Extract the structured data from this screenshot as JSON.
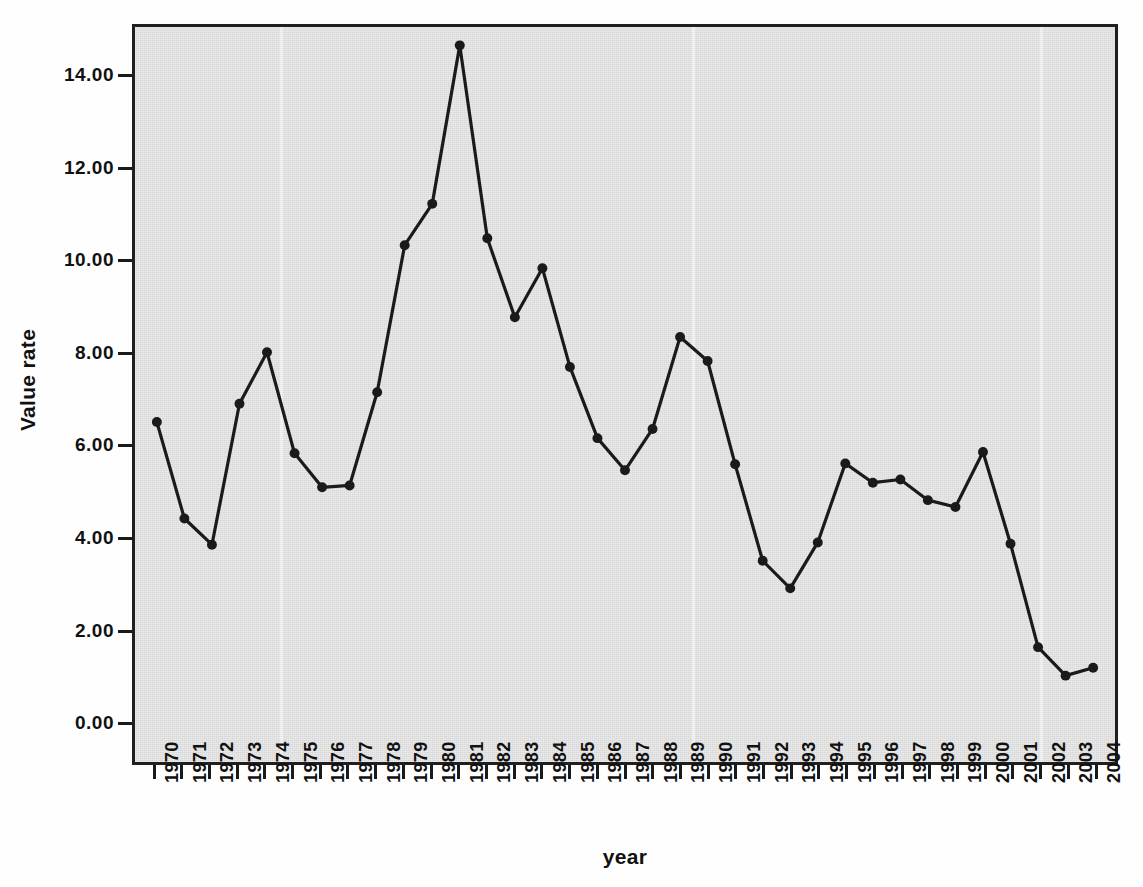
{
  "chart_data": {
    "type": "line",
    "title": "",
    "xlabel": "year",
    "ylabel": "Value rate",
    "x": [
      1970,
      1971,
      1972,
      1973,
      1974,
      1975,
      1976,
      1977,
      1978,
      1979,
      1980,
      1981,
      1982,
      1983,
      1984,
      1985,
      1986,
      1987,
      1988,
      1989,
      1990,
      1991,
      1992,
      1993,
      1994,
      1995,
      1996,
      1997,
      1998,
      1999,
      2000,
      2001,
      2002,
      2003,
      2004
    ],
    "categories": [
      "1970",
      "1971",
      "1972",
      "1973",
      "1974",
      "1975",
      "1976",
      "1977",
      "1978",
      "1979",
      "1980",
      "1981",
      "1982",
      "1983",
      "1984",
      "1985",
      "1986",
      "1987",
      "1988",
      "1989",
      "1990",
      "1991",
      "1992",
      "1993",
      "1994",
      "1995",
      "1996",
      "1997",
      "1998",
      "1999",
      "2000",
      "2001",
      "2002",
      "2003",
      "2004"
    ],
    "values": [
      6.5,
      4.4,
      3.83,
      6.9,
      8.02,
      5.82,
      5.08,
      5.12,
      7.15,
      10.35,
      11.25,
      14.7,
      10.5,
      8.78,
      9.85,
      7.7,
      6.15,
      5.45,
      6.35,
      8.35,
      7.83,
      5.58,
      3.48,
      2.88,
      3.88,
      5.6,
      5.18,
      5.25,
      4.8,
      4.65,
      5.85,
      3.85,
      1.6,
      0.98,
      1.15
    ],
    "series": [
      {
        "name": "Value rate",
        "values": [
          6.5,
          4.4,
          3.83,
          6.9,
          8.02,
          5.82,
          5.08,
          5.12,
          7.15,
          10.35,
          11.25,
          14.7,
          10.5,
          8.78,
          9.85,
          7.7,
          6.15,
          5.45,
          6.35,
          8.35,
          7.83,
          5.58,
          3.48,
          2.88,
          3.88,
          5.6,
          5.18,
          5.25,
          4.8,
          4.65,
          5.85,
          3.85,
          1.6,
          0.98,
          1.15
        ],
        "marker": "filled-circle",
        "color": "#1a1a1a"
      }
    ],
    "ylim": [
      -0.9,
      15.1
    ],
    "yticks": [
      0,
      2,
      4,
      6,
      8,
      10,
      12,
      14
    ],
    "ytick_labels": [
      "0.00",
      "2.00",
      "4.00",
      "6.00",
      "8.00",
      "10.00",
      "12.00",
      "14.00"
    ],
    "grid": false,
    "legend": null,
    "legend_position": "none",
    "colors": {
      "plot_background": "#d8d8d8",
      "figure_background": "#fefefe",
      "axis": "#1f1f1f",
      "line": "#1a1a1a",
      "marker": "#1a1a1a",
      "text": "#111111"
    }
  }
}
